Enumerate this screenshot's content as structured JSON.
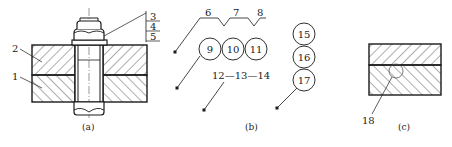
{
  "figure": {
    "panels": [
      {
        "id": "a",
        "caption": "(a)",
        "description": "bolted joint cross-section with two hatched plates",
        "part_labels": [
          "1",
          "2",
          "3",
          "4",
          "5"
        ]
      },
      {
        "id": "b",
        "caption": "(b)",
        "description": "leader line labelling conventions",
        "zigzag_labels": [
          "6",
          "7",
          "8"
        ],
        "circle_row_labels": [
          "9",
          "10",
          "11"
        ],
        "dash_labels": [
          "12",
          "13",
          "14"
        ],
        "dash_text": "12—13—14",
        "circle_stack_labels": [
          "15",
          "16",
          "17"
        ]
      },
      {
        "id": "c",
        "caption": "(c)",
        "description": "two hatched plates with circled joint",
        "part_labels": [
          "18"
        ]
      }
    ]
  },
  "colors": {
    "line": "#1a1a1a",
    "hatch": "#333333",
    "background": "#ffffff"
  }
}
